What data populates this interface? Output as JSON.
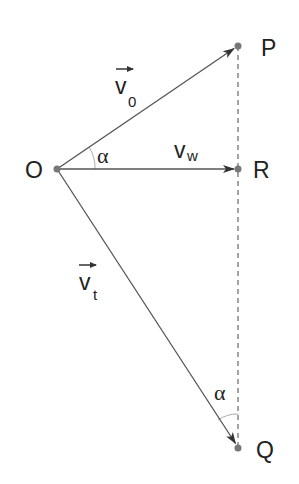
{
  "diagram": {
    "type": "vector-triangle",
    "points": {
      "O": {
        "label": "O",
        "x": 57,
        "y": 169
      },
      "P": {
        "label": "P",
        "x": 238,
        "y": 46
      },
      "R": {
        "label": "R",
        "x": 238,
        "y": 169
      },
      "Q": {
        "label": "Q",
        "x": 238,
        "y": 448
      }
    },
    "vectors": [
      {
        "from": "O",
        "to": "P",
        "name": "v",
        "subscript": "0",
        "has_arrow_over": true
      },
      {
        "from": "O",
        "to": "R",
        "name": "v",
        "subscript": "w",
        "has_arrow_over": false
      },
      {
        "from": "O",
        "to": "Q",
        "name": "v",
        "subscript": "t",
        "has_arrow_over": true
      }
    ],
    "dashed_line": {
      "from": "P",
      "to": "Q"
    },
    "angles": [
      {
        "label": "α",
        "vertex": "O",
        "between": [
          "OP",
          "OR"
        ]
      },
      {
        "label": "α",
        "vertex": "Q",
        "between": [
          "QO",
          "QP"
        ]
      }
    ],
    "colors": {
      "line": "#555555",
      "point": "#777777",
      "text": "#222222",
      "arc": "#aaaaaa"
    }
  }
}
